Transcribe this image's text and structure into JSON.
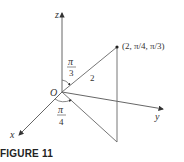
{
  "figure": {
    "caption": "FIGURE 11",
    "axes": {
      "x": "x",
      "y": "y",
      "z": "z"
    },
    "origin_label": "O",
    "point_label": "(2, π/4, π/3)",
    "radius_label": "2",
    "phi_label": {
      "num": "π",
      "den": "3"
    },
    "theta_label": {
      "num": "π",
      "den": "4"
    }
  }
}
